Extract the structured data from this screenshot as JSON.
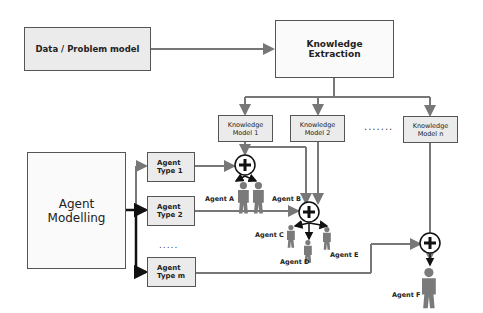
{
  "diagram": {
    "data_model": {
      "label": "Data / Problem model"
    },
    "knowledge_extraction": {
      "line1": "Knowledge",
      "line2": "Extraction"
    },
    "knowledge_models": [
      {
        "line1": "Knowledge",
        "line2": "Model 1"
      },
      {
        "line1": "Knowledge",
        "line2": "Model 2"
      },
      {
        "line1": "Knowledge",
        "line2": "Model n"
      }
    ],
    "km_ellipsis": ".......",
    "agent_modelling": {
      "line1": "Agent",
      "line2": "Modelling"
    },
    "agent_types": [
      {
        "line1": "Agent",
        "line2": "Type 1"
      },
      {
        "line1": "Agent",
        "line2": "Type 2"
      },
      {
        "line1": "Agent",
        "line2": "Type m"
      }
    ],
    "type_ellipsis": ".....",
    "agents": [
      "Agent A",
      "Agent B",
      "Agent C",
      "Agent D",
      "Agent E",
      "Agent F"
    ],
    "colors": {
      "line": "#777777",
      "dark_line": "#222222",
      "box_fill": "#ebebeb",
      "person": "#7a7a7a"
    }
  }
}
